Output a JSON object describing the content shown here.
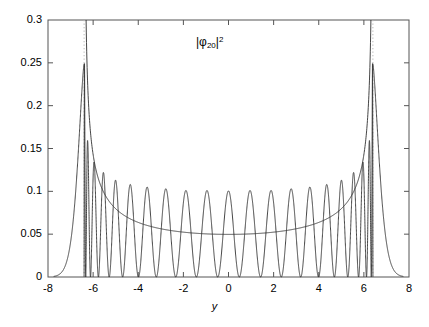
{
  "chart_data": {
    "type": "line",
    "title": "",
    "subtitle": "",
    "xlabel": "y",
    "ylabel": "",
    "xlim": [
      -8,
      8
    ],
    "ylim": [
      0,
      0.3
    ],
    "grid": false,
    "legend_position": "none",
    "xticks": [
      -8,
      -6,
      -4,
      -2,
      0,
      2,
      4,
      6,
      8
    ],
    "xtick_labels": [
      "-8",
      "-6",
      "-4",
      "-2",
      "0",
      "2",
      "4",
      "6",
      "8"
    ],
    "yticks": [
      0,
      0.05,
      0.1,
      0.15,
      0.2,
      0.25,
      0.3
    ],
    "ytick_labels": [
      "0",
      "0.05",
      "0.1",
      "0.15",
      "0.2",
      "0.25",
      "0.3"
    ],
    "annotations": [
      {
        "name": "series-label",
        "text_plain": "|phi_20|^2",
        "base": "|φ",
        "subscript": "20",
        "after": "|",
        "superscript": "2",
        "x": 0.0,
        "y": 0.272
      }
    ],
    "series": [
      {
        "name": "quantum-probability-density",
        "type": "oscillating",
        "color": "#303030",
        "linewidth": 0.9,
        "description": "|phi_20(y)|^2 quantum harmonic oscillator probability density, 21 antinodes between the classical turning points",
        "n": 20,
        "antinode_count": 21,
        "turning_points": [
          -6.4,
          6.4
        ],
        "peak_values_left_to_right": [
          0.249,
          0.158,
          0.134,
          0.122,
          0.113,
          0.108,
          0.105,
          0.103,
          0.101,
          0.101,
          0.1005,
          0.101,
          0.101,
          0.103,
          0.105,
          0.108,
          0.113,
          0.122,
          0.134,
          0.158,
          0.249
        ],
        "node_value": 0.0,
        "max_value": 0.251,
        "outer_decay_zero_near": [
          -7.6,
          7.6
        ]
      },
      {
        "name": "classical-probability-envelope",
        "type": "smooth",
        "color": "#303030",
        "linewidth": 0.9,
        "description": "Classical probability distribution 1/(pi*sqrt(a^2 - y^2)) with a = 6.4; diverges at the turning points",
        "turning_points": [
          -6.4,
          6.4
        ],
        "center_value": 0.0505,
        "sample_points": [
          {
            "y": -6.35,
            "p": 0.3
          },
          {
            "y": -6.2,
            "p": 0.2495
          },
          {
            "y": -6.0,
            "p": 0.1845
          },
          {
            "y": -5.8,
            "p": 0.1493
          },
          {
            "y": -5.6,
            "p": 0.1268
          },
          {
            "y": -5.4,
            "p": 0.1113
          },
          {
            "y": -5.0,
            "p": 0.0905
          },
          {
            "y": -4.5,
            "p": 0.0752
          },
          {
            "y": -4.0,
            "p": 0.0662
          },
          {
            "y": -3.5,
            "p": 0.0604
          },
          {
            "y": -3.0,
            "p": 0.0566
          },
          {
            "y": -2.5,
            "p": 0.0541
          },
          {
            "y": -2.0,
            "p": 0.0524
          },
          {
            "y": -1.5,
            "p": 0.0513
          },
          {
            "y": -1.0,
            "p": 0.0507
          },
          {
            "y": -0.5,
            "p": 0.0504
          },
          {
            "y": 0.0,
            "p": 0.0505
          },
          {
            "y": 0.5,
            "p": 0.0504
          },
          {
            "y": 1.0,
            "p": 0.0507
          },
          {
            "y": 1.5,
            "p": 0.0513
          },
          {
            "y": 2.0,
            "p": 0.0524
          },
          {
            "y": 2.5,
            "p": 0.0541
          },
          {
            "y": 3.0,
            "p": 0.0566
          },
          {
            "y": 3.5,
            "p": 0.0604
          },
          {
            "y": 4.0,
            "p": 0.0662
          },
          {
            "y": 4.5,
            "p": 0.0752
          },
          {
            "y": 5.0,
            "p": 0.0905
          },
          {
            "y": 5.4,
            "p": 0.1113
          },
          {
            "y": 5.6,
            "p": 0.1268
          },
          {
            "y": 5.8,
            "p": 0.1493
          },
          {
            "y": 6.0,
            "p": 0.1845
          },
          {
            "y": 6.2,
            "p": 0.2495
          },
          {
            "y": 6.35,
            "p": 0.3
          }
        ]
      },
      {
        "name": "turning-point-markers",
        "type": "vertical-dotted",
        "color": "#b9b9b9",
        "linewidth": 1,
        "description": "Dotted vertical lines at the classical turning points",
        "x_values": [
          -6.4,
          6.4
        ]
      }
    ]
  },
  "axes": {
    "frame_color": "#555555",
    "tick_color": "#555555",
    "x_axis_label": "y"
  }
}
